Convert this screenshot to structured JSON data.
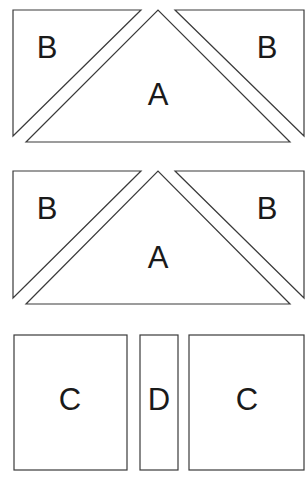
{
  "diagram": {
    "title": "",
    "stroke_color": "#3a3a3a",
    "label_color": "#1a1a1a",
    "background": "#ffffff",
    "groups": [
      {
        "name": "flying-geese-unit-1",
        "pieces": [
          {
            "id": "B",
            "label": "B",
            "shape": "triangle",
            "points": "13,10 141,10 13,136",
            "label_x": 47,
            "label_y": 58
          },
          {
            "id": "A",
            "label": "A",
            "shape": "triangle",
            "points": "26,142 158,10 290,142",
            "label_x": 158,
            "label_y": 105
          },
          {
            "id": "B",
            "label": "B",
            "shape": "triangle",
            "points": "175,10 304,10 304,136",
            "label_x": 267,
            "label_y": 58
          }
        ]
      },
      {
        "name": "flying-geese-unit-2",
        "pieces": [
          {
            "id": "B",
            "label": "B",
            "shape": "triangle",
            "points": "13,171 141,171 13,298",
            "label_x": 47,
            "label_y": 219
          },
          {
            "id": "A",
            "label": "A",
            "shape": "triangle",
            "points": "26,304 158,171 290,304",
            "label_x": 158,
            "label_y": 268
          },
          {
            "id": "B",
            "label": "B",
            "shape": "triangle",
            "points": "175,171 304,171 304,298",
            "label_x": 267,
            "label_y": 219
          }
        ]
      },
      {
        "name": "rectangles-row",
        "pieces": [
          {
            "id": "C",
            "label": "C",
            "shape": "rect",
            "x": 14,
            "y": 335,
            "w": 113,
            "h": 135,
            "label_x": 70,
            "label_y": 410
          },
          {
            "id": "D",
            "label": "D",
            "shape": "rect",
            "x": 140,
            "y": 335,
            "w": 38,
            "h": 135,
            "label_x": 159,
            "label_y": 410
          },
          {
            "id": "C",
            "label": "C",
            "shape": "rect",
            "x": 189,
            "y": 335,
            "w": 115,
            "h": 135,
            "label_x": 247,
            "label_y": 410
          }
        ]
      }
    ]
  }
}
